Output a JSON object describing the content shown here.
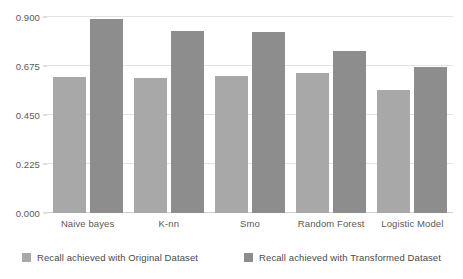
{
  "chart_data": {
    "type": "bar",
    "title": "",
    "subtitle": "",
    "xlabel": "",
    "ylabel": "",
    "categories": [
      "Naive bayes",
      "K-nn",
      "Smo",
      "Random Forest",
      "Logistic Model"
    ],
    "series": [
      {
        "name": "Recall achieved with Original Dataset",
        "color": "#a8a8a8",
        "values": [
          0.625,
          0.618,
          0.63,
          0.645,
          0.565
        ]
      },
      {
        "name": "Recall achieved with Transformed Dataset",
        "color": "#8d8d8d",
        "values": [
          0.893,
          0.838,
          0.83,
          0.742,
          0.67
        ]
      }
    ],
    "ylim": [
      0.0,
      0.9
    ],
    "yticks": [
      0.0,
      0.225,
      0.45,
      0.675,
      0.9
    ],
    "ytick_labels": [
      "0.000",
      "0.225",
      "0.450",
      "0.675",
      "0.900"
    ],
    "grid": true,
    "legend_position": "bottom",
    "annotations": []
  },
  "legend": {
    "items": [
      {
        "label": "Recall achieved with Original Dataset",
        "swatch": "legend-swatch-original"
      },
      {
        "label": "Recall achieved with Transformed Dataset",
        "swatch": "legend-swatch-transformed"
      }
    ]
  },
  "colors": {
    "series_original": "#a8a8a8",
    "series_transformed": "#8d8d8d",
    "gridline": "#e2e2e2",
    "baseline": "#cfcfcf",
    "text": "#5a5a5a",
    "background": "#ffffff"
  }
}
